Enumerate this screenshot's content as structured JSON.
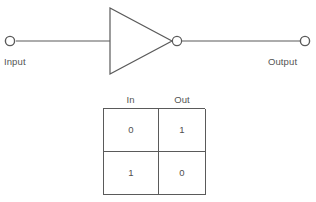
{
  "diagram": {
    "type": "logic-gate-schematic",
    "gate": {
      "name": "inverter",
      "symbol": "NOT",
      "shape": "triangle-with-bubble"
    },
    "ports": {
      "input_label": "Input",
      "output_label": "Output"
    },
    "colors": {
      "line": "#5a5a5a",
      "text": "#545454",
      "background": "#ffffff"
    }
  },
  "truth_table": {
    "headers": [
      "In",
      "Out"
    ],
    "rows": [
      {
        "in": "0",
        "out": "1"
      },
      {
        "in": "1",
        "out": "0"
      }
    ]
  }
}
